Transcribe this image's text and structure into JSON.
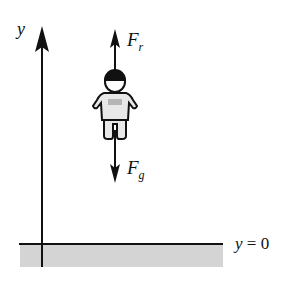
{
  "diagram": {
    "axis_label": "y",
    "forces": [
      {
        "symbol": "F",
        "subscript": "r",
        "direction": "up"
      },
      {
        "symbol": "F",
        "subscript": "g",
        "direction": "down"
      }
    ],
    "ground_label": {
      "var": "y",
      "rest": " = 0"
    },
    "colors": {
      "ink": "#111111",
      "ground_fill": "#d4d4d4",
      "helmet": "#111111",
      "body_fill": "#e8e8e8"
    }
  }
}
